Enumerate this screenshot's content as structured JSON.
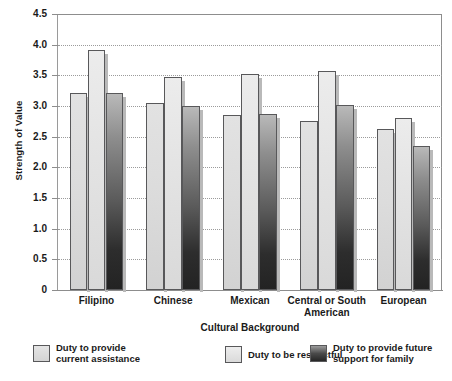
{
  "chart_data": {
    "type": "bar",
    "title": "",
    "xlabel": "Cultural Background",
    "ylabel": "Strength of Value",
    "ylim": [
      0,
      4.5
    ],
    "yticks": [
      "0",
      "0.5",
      "1.0",
      "1.5",
      "2.0",
      "2.5",
      "3.0",
      "3.5",
      "4.0",
      "4.5"
    ],
    "ytick_values": [
      0,
      0.5,
      1.0,
      1.5,
      2.0,
      2.5,
      3.0,
      3.5,
      4.0,
      4.5
    ],
    "grid": true,
    "legend_position": "bottom",
    "categories": [
      "Filipino",
      "Chinese",
      "Mexican",
      "Central or South American",
      "European"
    ],
    "series": [
      {
        "name": "Duty to provide current assistance",
        "color": "#dcdcdc",
        "values": [
          3.22,
          3.05,
          2.85,
          2.75,
          2.62
        ]
      },
      {
        "name": "Duty to be respectful",
        "color": "#e6e6e6",
        "values": [
          3.92,
          3.48,
          3.52,
          3.57,
          2.8
        ]
      },
      {
        "name": "Duty to provide future support for family",
        "color": "#2d2d2d",
        "values": [
          3.22,
          3.0,
          2.87,
          3.02,
          2.35
        ]
      }
    ]
  },
  "legend": {
    "items": [
      {
        "label": "Duty to provide\ncurrent assistance"
      },
      {
        "label": "Duty to be respectful"
      },
      {
        "label": "Duty to provide future\nsupport for family"
      }
    ]
  }
}
